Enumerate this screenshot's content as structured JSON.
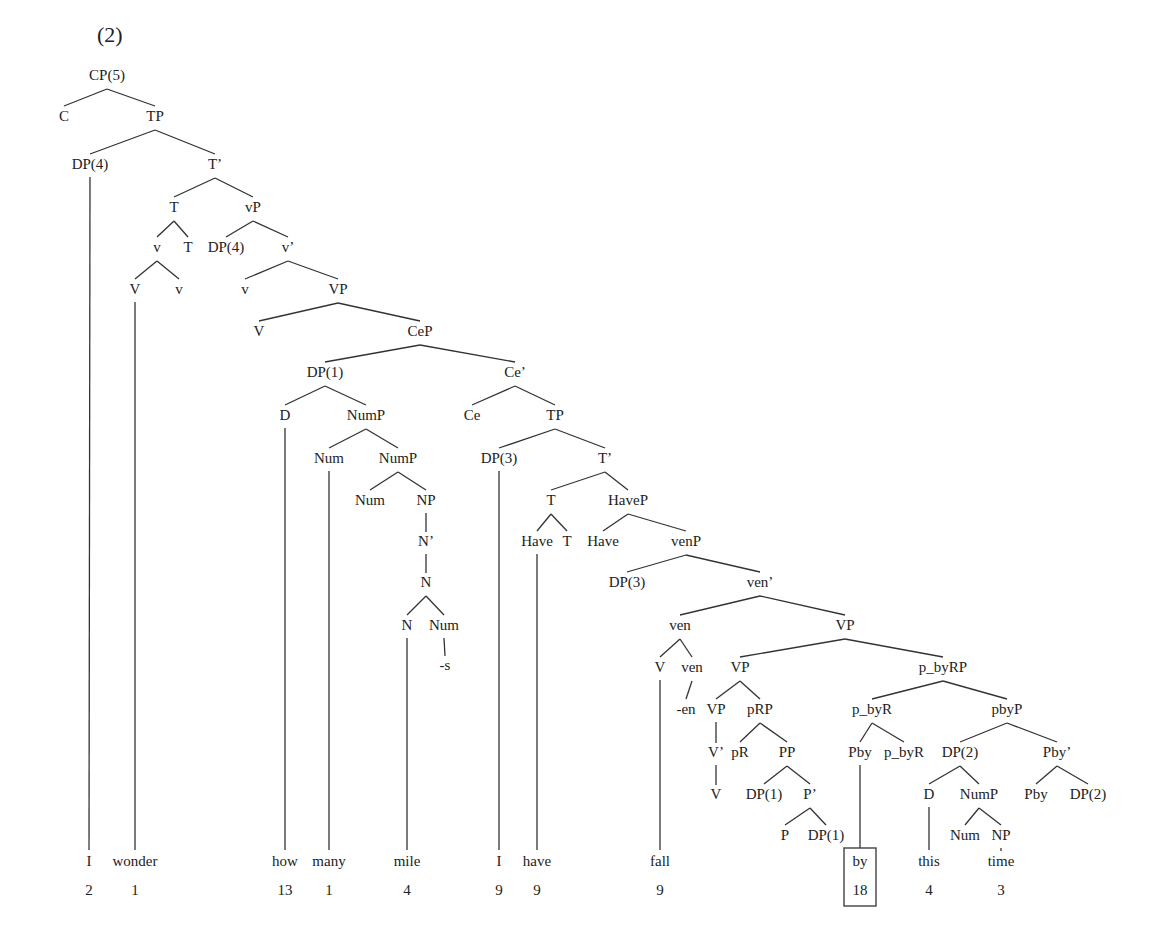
{
  "example_number": "(2)",
  "colors": {
    "ink": "#222222",
    "line": "#333333",
    "background": "#ffffff"
  },
  "nodes": [
    {
      "id": "cp",
      "label": "CP(5)",
      "x": 107,
      "y": 80
    },
    {
      "id": "c",
      "label": "C",
      "x": 64,
      "y": 121
    },
    {
      "id": "tp1",
      "label": "TP",
      "x": 155,
      "y": 121
    },
    {
      "id": "dp4a",
      "label": "DP(4)",
      "x": 90,
      "y": 169
    },
    {
      "id": "tbar1",
      "label": "T’",
      "x": 215,
      "y": 169
    },
    {
      "id": "t1",
      "label": "T",
      "x": 174,
      "y": 212
    },
    {
      "id": "vp_small",
      "label": "vP",
      "x": 253,
      "y": 212
    },
    {
      "id": "v1",
      "label": "v",
      "x": 157,
      "y": 252
    },
    {
      "id": "t2",
      "label": "T",
      "x": 188,
      "y": 252
    },
    {
      "id": "dp4b",
      "label": "DP(4)",
      "x": 226,
      "y": 252
    },
    {
      "id": "vbar",
      "label": "v’",
      "x": 288,
      "y": 252
    },
    {
      "id": "V1",
      "label": "V",
      "x": 135,
      "y": 294
    },
    {
      "id": "v2",
      "label": "v",
      "x": 179,
      "y": 294
    },
    {
      "id": "v3",
      "label": "v",
      "x": 245,
      "y": 294
    },
    {
      "id": "VP1",
      "label": "VP",
      "x": 338,
      "y": 294
    },
    {
      "id": "V2",
      "label": "V",
      "x": 259,
      "y": 336
    },
    {
      "id": "cep",
      "label": "CeP",
      "x": 420,
      "y": 336
    },
    {
      "id": "dp1a",
      "label": "DP(1)",
      "x": 325,
      "y": 377
    },
    {
      "id": "cebar",
      "label": "Ce’",
      "x": 515,
      "y": 377
    },
    {
      "id": "d1",
      "label": "D",
      "x": 285,
      "y": 420
    },
    {
      "id": "nump1",
      "label": "NumP",
      "x": 366,
      "y": 420
    },
    {
      "id": "ce",
      "label": "Ce",
      "x": 472,
      "y": 420
    },
    {
      "id": "tp2",
      "label": "TP",
      "x": 555,
      "y": 420
    },
    {
      "id": "num1",
      "label": "Num",
      "x": 329,
      "y": 463
    },
    {
      "id": "nump2",
      "label": "NumP",
      "x": 398,
      "y": 463
    },
    {
      "id": "dp3a",
      "label": "DP(3)",
      "x": 499,
      "y": 463
    },
    {
      "id": "tbar2",
      "label": "T’",
      "x": 605,
      "y": 463
    },
    {
      "id": "num2",
      "label": "Num",
      "x": 370,
      "y": 505
    },
    {
      "id": "np1",
      "label": "NP",
      "x": 426,
      "y": 505
    },
    {
      "id": "t3",
      "label": "T",
      "x": 551,
      "y": 505
    },
    {
      "id": "havep",
      "label": "HaveP",
      "x": 628,
      "y": 505
    },
    {
      "id": "nbar",
      "label": "N’",
      "x": 426,
      "y": 546
    },
    {
      "id": "have1",
      "label": "Have",
      "x": 537,
      "y": 546
    },
    {
      "id": "t4",
      "label": "T",
      "x": 567,
      "y": 546
    },
    {
      "id": "have2",
      "label": "Have",
      "x": 603,
      "y": 546
    },
    {
      "id": "venp",
      "label": "venP",
      "x": 686,
      "y": 546
    },
    {
      "id": "n1",
      "label": "N",
      "x": 426,
      "y": 587
    },
    {
      "id": "dp3b",
      "label": "DP(3)",
      "x": 627,
      "y": 587
    },
    {
      "id": "venbar",
      "label": "ven’",
      "x": 760,
      "y": 587
    },
    {
      "id": "n2",
      "label": "N",
      "x": 407,
      "y": 630
    },
    {
      "id": "num3",
      "label": "Num",
      "x": 444,
      "y": 630
    },
    {
      "id": "ven1",
      "label": "ven",
      "x": 680,
      "y": 630
    },
    {
      "id": "VP2",
      "label": "VP",
      "x": 845,
      "y": 630
    },
    {
      "id": "s_suffix",
      "label": "-s",
      "x": 445,
      "y": 670
    },
    {
      "id": "V3",
      "label": "V",
      "x": 660,
      "y": 672
    },
    {
      "id": "ven2",
      "label": "ven",
      "x": 692,
      "y": 672
    },
    {
      "id": "VP3",
      "label": "VP",
      "x": 740,
      "y": 672
    },
    {
      "id": "pbyrp",
      "label": "p_byRP",
      "x": 943,
      "y": 672
    },
    {
      "id": "en_suffix",
      "label": "-en",
      "x": 686,
      "y": 714
    },
    {
      "id": "VP4",
      "label": "VP",
      "x": 716,
      "y": 714
    },
    {
      "id": "prp",
      "label": "pRP",
      "x": 760,
      "y": 714
    },
    {
      "id": "pbyr1",
      "label": "p_byR",
      "x": 872,
      "y": 714
    },
    {
      "id": "pbyp",
      "label": "pbyP",
      "x": 1007,
      "y": 714
    },
    {
      "id": "vbar2",
      "label": "V’",
      "x": 716,
      "y": 757
    },
    {
      "id": "pr",
      "label": "pR",
      "x": 740,
      "y": 757
    },
    {
      "id": "pp",
      "label": "PP",
      "x": 787,
      "y": 757
    },
    {
      "id": "pby1",
      "label": "Pby",
      "x": 860,
      "y": 757
    },
    {
      "id": "pbyr2",
      "label": "p_byR",
      "x": 904,
      "y": 757
    },
    {
      "id": "dp2a",
      "label": "DP(2)",
      "x": 960,
      "y": 757
    },
    {
      "id": "pbybar",
      "label": "Pby’",
      "x": 1057,
      "y": 757
    },
    {
      "id": "V4",
      "label": "V",
      "x": 716,
      "y": 799
    },
    {
      "id": "dp1b",
      "label": "DP(1)",
      "x": 764,
      "y": 799
    },
    {
      "id": "pbar",
      "label": "P’",
      "x": 810,
      "y": 799
    },
    {
      "id": "d2",
      "label": "D",
      "x": 929,
      "y": 799
    },
    {
      "id": "nump3",
      "label": "NumP",
      "x": 979,
      "y": 799
    },
    {
      "id": "pby2",
      "label": "Pby",
      "x": 1036,
      "y": 799
    },
    {
      "id": "dp2b",
      "label": "DP(2)",
      "x": 1088,
      "y": 799
    },
    {
      "id": "p",
      "label": "P",
      "x": 785,
      "y": 840
    },
    {
      "id": "dp1c",
      "label": "DP(1)",
      "x": 826,
      "y": 840
    },
    {
      "id": "num4",
      "label": "Num",
      "x": 965,
      "y": 840
    },
    {
      "id": "np2",
      "label": "NP",
      "x": 1001,
      "y": 840
    }
  ],
  "words": [
    {
      "id": "w_i1",
      "label": "I",
      "count": "2",
      "x": 89
    },
    {
      "id": "w_wonder",
      "label": "wonder",
      "count": "1",
      "x": 135
    },
    {
      "id": "w_how",
      "label": "how",
      "count": "13",
      "x": 285
    },
    {
      "id": "w_many",
      "label": "many",
      "count": "1",
      "x": 329
    },
    {
      "id": "w_mile",
      "label": "mile",
      "count": "4",
      "x": 407
    },
    {
      "id": "w_i2",
      "label": "I",
      "count": "9",
      "x": 499
    },
    {
      "id": "w_have",
      "label": "have",
      "count": "9",
      "x": 537
    },
    {
      "id": "w_fall",
      "label": "fall",
      "count": "9",
      "x": 660
    },
    {
      "id": "w_by",
      "label": "by",
      "count": "18",
      "x": 860,
      "highlighted": true
    },
    {
      "id": "w_this",
      "label": "this",
      "count": "4",
      "x": 929
    },
    {
      "id": "w_time",
      "label": "time",
      "count": "3",
      "x": 1001
    }
  ],
  "word_row_y": 866,
  "count_row_y": 895,
  "edges": [
    [
      "cp",
      "c"
    ],
    [
      "cp",
      "tp1"
    ],
    [
      "tp1",
      "dp4a"
    ],
    [
      "tp1",
      "tbar1"
    ],
    [
      "tbar1",
      "t1"
    ],
    [
      "tbar1",
      "vp_small"
    ],
    [
      "t1",
      "v1"
    ],
    [
      "t1",
      "t2"
    ],
    [
      "vp_small",
      "dp4b"
    ],
    [
      "vp_small",
      "vbar"
    ],
    [
      "v1",
      "V1"
    ],
    [
      "v1",
      "v2"
    ],
    [
      "vbar",
      "v3"
    ],
    [
      "vbar",
      "VP1"
    ],
    [
      "VP1",
      "V2"
    ],
    [
      "VP1",
      "cep"
    ],
    [
      "cep",
      "dp1a"
    ],
    [
      "cep",
      "cebar"
    ],
    [
      "dp1a",
      "d1"
    ],
    [
      "dp1a",
      "nump1"
    ],
    [
      "cebar",
      "ce"
    ],
    [
      "cebar",
      "tp2"
    ],
    [
      "nump1",
      "num1"
    ],
    [
      "nump1",
      "nump2"
    ],
    [
      "tp2",
      "dp3a"
    ],
    [
      "tp2",
      "tbar2"
    ],
    [
      "nump2",
      "num2"
    ],
    [
      "nump2",
      "np1"
    ],
    [
      "tbar2",
      "t3"
    ],
    [
      "tbar2",
      "havep"
    ],
    [
      "np1",
      "nbar"
    ],
    [
      "nbar",
      "n1"
    ],
    [
      "t3",
      "have1"
    ],
    [
      "t3",
      "t4"
    ],
    [
      "havep",
      "have2"
    ],
    [
      "havep",
      "venp"
    ],
    [
      "n1",
      "n2"
    ],
    [
      "n1",
      "num3"
    ],
    [
      "num3",
      "s_suffix"
    ],
    [
      "venp",
      "dp3b"
    ],
    [
      "venp",
      "venbar"
    ],
    [
      "venbar",
      "ven1"
    ],
    [
      "venbar",
      "VP2"
    ],
    [
      "ven1",
      "V3"
    ],
    [
      "ven1",
      "ven2"
    ],
    [
      "ven2",
      "en_suffix"
    ],
    [
      "VP2",
      "VP3"
    ],
    [
      "VP2",
      "pbyrp"
    ],
    [
      "VP3",
      "VP4"
    ],
    [
      "VP3",
      "prp"
    ],
    [
      "VP4",
      "vbar2"
    ],
    [
      "vbar2",
      "V4"
    ],
    [
      "prp",
      "pr"
    ],
    [
      "prp",
      "pp"
    ],
    [
      "pp",
      "dp1b"
    ],
    [
      "pp",
      "pbar"
    ],
    [
      "pbar",
      "p"
    ],
    [
      "pbar",
      "dp1c"
    ],
    [
      "pbyrp",
      "pbyr1"
    ],
    [
      "pbyrp",
      "pbyp"
    ],
    [
      "pbyr1",
      "pby1"
    ],
    [
      "pbyr1",
      "pbyr2"
    ],
    [
      "pbyp",
      "dp2a"
    ],
    [
      "pbyp",
      "pbybar"
    ],
    [
      "dp2a",
      "d2"
    ],
    [
      "dp2a",
      "nump3"
    ],
    [
      "pbybar",
      "pby2"
    ],
    [
      "pbybar",
      "dp2b"
    ],
    [
      "nump3",
      "num4"
    ],
    [
      "nump3",
      "np2"
    ],
    [
      "np2",
      "w_time"
    ]
  ],
  "leaf_links": [
    [
      "dp4a",
      "w_i1"
    ],
    [
      "V1",
      "w_wonder"
    ],
    [
      "d1",
      "w_how"
    ],
    [
      "num1",
      "w_many"
    ],
    [
      "n2",
      "w_mile"
    ],
    [
      "dp3a",
      "w_i2"
    ],
    [
      "have1",
      "w_have"
    ],
    [
      "V3",
      "w_fall"
    ],
    [
      "pby1",
      "w_by"
    ],
    [
      "d2",
      "w_this"
    ]
  ]
}
